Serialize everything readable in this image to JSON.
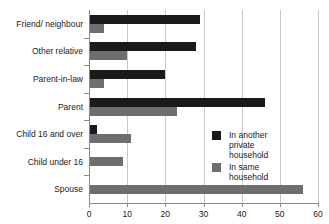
{
  "chart_data": {
    "type": "bar",
    "orientation": "horizontal",
    "title": "",
    "xlabel": "",
    "ylabel": "",
    "xlim": [
      0,
      60
    ],
    "xticks": [
      0,
      10,
      20,
      30,
      40,
      50,
      60
    ],
    "grid": "vertical",
    "legend_position": "inside-right",
    "categories": [
      "Friend/ neighbour",
      "Other relative",
      "Parent-in-law",
      "Parent",
      "Child 16 and over",
      "Child under 16",
      "Spouse"
    ],
    "series": [
      {
        "name": "In another private household",
        "color": "#1a1a1a",
        "values": [
          29,
          28,
          20,
          46,
          2,
          0,
          0
        ]
      },
      {
        "name": "In same household",
        "color": "#6e6e6e",
        "values": [
          4,
          10,
          4,
          23,
          11,
          9,
          56
        ]
      }
    ]
  },
  "legend": {
    "items": [
      {
        "label": "In another private\nhousehold",
        "swatch": "#1a1a1a"
      },
      {
        "label": "In same household",
        "swatch": "#6e6e6e"
      }
    ]
  },
  "axis": {
    "tick_labels": [
      "0",
      "10",
      "20",
      "30",
      "40",
      "50",
      "60"
    ]
  },
  "colors": {
    "other_household": "#1a1a1a",
    "same_household": "#6e6e6e",
    "gridline": "#c9c9c9",
    "axis": "#8a8a8a",
    "background": "#ffffff",
    "text": "#1a1a1a"
  }
}
